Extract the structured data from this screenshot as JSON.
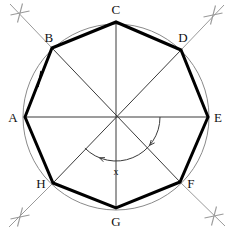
{
  "figure": {
    "canvas": {
      "width": 231,
      "height": 234
    },
    "colors": {
      "ink": "#111111",
      "polygon_stroke": "#000000",
      "circle_stroke": "#8a8a8a",
      "diagonal_stroke": "#3a3a3a",
      "construction_stroke": "#9a9a9a",
      "background": "#ffffff"
    },
    "circle": {
      "center_x": 116,
      "center_y": 117,
      "radius": 93,
      "stroke_width": 1
    },
    "polygon": {
      "name": "octagon",
      "sides": 8,
      "stroke_width": 3,
      "vertices": [
        {
          "id": "A",
          "label": "A",
          "x": 25,
          "y": 117,
          "label_x": 13,
          "label_y": 117
        },
        {
          "id": "B",
          "label": "B",
          "x": 52,
          "y": 48,
          "label_x": 49,
          "label_y": 37
        },
        {
          "id": "C",
          "label": "C",
          "x": 116,
          "y": 22,
          "label_x": 116,
          "label_y": 9
        },
        {
          "id": "D",
          "label": "D",
          "x": 181,
          "y": 50,
          "label_x": 183,
          "label_y": 37
        },
        {
          "id": "E",
          "label": "E",
          "x": 208,
          "y": 117,
          "label_x": 218,
          "label_y": 117
        },
        {
          "id": "F",
          "label": "F",
          "x": 180,
          "y": 182,
          "label_x": 191,
          "label_y": 183
        },
        {
          "id": "G",
          "label": "G",
          "x": 116,
          "y": 208,
          "label_x": 116,
          "label_y": 221
        },
        {
          "id": "H",
          "label": "H",
          "x": 53,
          "y": 183,
          "label_x": 41,
          "label_y": 183
        }
      ]
    },
    "diagonals": [
      {
        "id": "A-E",
        "from": "A",
        "to": "E"
      },
      {
        "id": "C-G",
        "from": "C",
        "to": "G"
      },
      {
        "id": "B-F",
        "from": "B",
        "to": "F"
      },
      {
        "id": "D-H",
        "from": "D",
        "to": "H"
      }
    ],
    "construction_rays": [
      {
        "id": "ray-top-left",
        "x1": 52,
        "y1": 48,
        "x2": 10,
        "y2": 4
      },
      {
        "id": "ray-top-right",
        "x1": 181,
        "y1": 50,
        "x2": 224,
        "y2": 5
      },
      {
        "id": "ray-bottom-left",
        "x1": 53,
        "y1": 183,
        "x2": 9,
        "y2": 227
      },
      {
        "id": "ray-bottom-right",
        "x1": 180,
        "y1": 182,
        "x2": 225,
        "y2": 226
      }
    ],
    "construction_crosses": [
      {
        "id": "cross-top-left",
        "x": 20,
        "y": 13,
        "size": 19
      },
      {
        "id": "cross-top-right",
        "x": 213,
        "y": 15,
        "size": 19
      },
      {
        "id": "cross-bottom-left",
        "x": 20,
        "y": 217,
        "size": 19
      },
      {
        "id": "cross-bottom-right",
        "x": 214,
        "y": 216,
        "size": 19
      }
    ],
    "angle_arc": {
      "id": "central-angle-arc",
      "center_x": 116,
      "center_y": 117,
      "radius": 44,
      "start_angle_deg": 0,
      "end_angle_deg": 135,
      "note": "arc swept from the horizontal ray toward E round to the diagonal ray toward H",
      "tick_marks": 2,
      "label": "x",
      "label_x": 116,
      "label_y": 172
    },
    "edge_tick": {
      "id": "edge-tick-AB",
      "x1": 38,
      "y1": 87,
      "x2": 41,
      "y2": 71
    }
  }
}
